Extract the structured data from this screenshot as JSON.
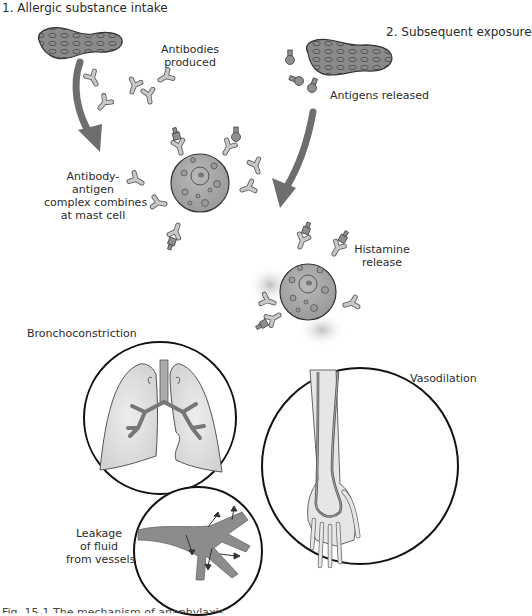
{
  "steps": {
    "step1": "1. Allergic substance intake",
    "step2": "2. Subsequent exposure"
  },
  "labels": {
    "antibodies_produced_line1": "Antibodies",
    "antibodies_produced_line2": "produced",
    "antigens_released": "Antigens released",
    "complex_line1": "Antibody-",
    "complex_line2": "antigen",
    "complex_line3": "complex combines",
    "complex_line4": "at mast cell",
    "histamine_line1": "Histamine",
    "histamine_line2": "release",
    "bronchoconstriction": "Bronchoconstriction",
    "vasodilation": "Vasodilation",
    "leakage_line1": "Leakage",
    "leakage_line2": "of fluid",
    "leakage_line3": "from vessels"
  },
  "caption": "Fig. 15-1   The mechanism of anaphylaxis.",
  "colors": {
    "fill_gray": "#a9a9a9",
    "light_gray": "#d4d4d4",
    "arrow_gray": "#707070",
    "outline": "#1a1a1a",
    "lung_fill": "#dcdcdc",
    "vessel_fill": "#8c8c8c"
  }
}
